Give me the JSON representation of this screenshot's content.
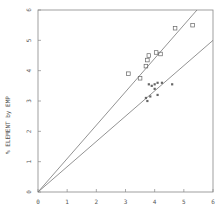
{
  "chart_data": {
    "type": "scatter",
    "title": "",
    "xlabel": "",
    "ylabel": "% ELEMENT by EMP",
    "xlim": [
      0,
      6
    ],
    "ylim": [
      0,
      6
    ],
    "x_ticks": [
      "0",
      "1",
      "2",
      "3",
      "4",
      "5",
      "6"
    ],
    "y_ticks": [
      "0",
      "1",
      "2",
      "3",
      "4",
      "5",
      "6"
    ],
    "grid": false,
    "legend": null,
    "series": [
      {
        "name": "open squares",
        "marker": "open-square",
        "points": [
          [
            3.1,
            3.9
          ],
          [
            3.5,
            3.75
          ],
          [
            3.7,
            4.15
          ],
          [
            3.75,
            4.35
          ],
          [
            3.8,
            4.5
          ],
          [
            4.05,
            4.6
          ],
          [
            4.2,
            4.55
          ],
          [
            4.7,
            5.4
          ],
          [
            5.3,
            5.5
          ]
        ]
      },
      {
        "name": "filled points",
        "marker": "filled",
        "points": [
          [
            3.8,
            3.55
          ],
          [
            3.9,
            3.5
          ],
          [
            4.0,
            3.55
          ],
          [
            4.1,
            3.6
          ],
          [
            4.25,
            3.6
          ],
          [
            4.6,
            3.55
          ],
          [
            4.0,
            3.4
          ],
          [
            3.85,
            3.15
          ],
          [
            3.7,
            3.1
          ],
          [
            4.1,
            3.2
          ],
          [
            3.75,
            3.0
          ]
        ]
      }
    ],
    "lines": [
      {
        "name": "upper fit line",
        "from": [
          0,
          0
        ],
        "to": [
          5.45,
          6
        ]
      },
      {
        "name": "lower fit line",
        "from": [
          0,
          0
        ],
        "to": [
          6,
          5.0
        ]
      }
    ]
  },
  "colors": {
    "axis": "#888888",
    "line": "#777777",
    "marker": "#666666"
  }
}
